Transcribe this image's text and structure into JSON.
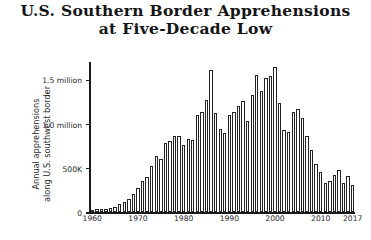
{
  "title": {
    "line1": "U.S. Southern Border Apprehensions",
    "line2": "at Five-Decade Low"
  },
  "axis": {
    "y_title_line1": "Annual apprehensions",
    "y_title_line2": "along U.S. southwest border",
    "y_ticks": [
      {
        "label": "0",
        "value": 0
      },
      {
        "label": "500K",
        "value": 500000
      },
      {
        "label": "1.0 million",
        "value": 1000000
      },
      {
        "label": "1.5 million",
        "value": 1500000
      }
    ],
    "x_ticks": [
      "1960",
      "1970",
      "1980",
      "1990",
      "2000",
      "2010",
      "2017"
    ]
  },
  "colors": {
    "background": "#ffffff",
    "axis": "#1a1a1a",
    "bar_fill": "#ffffff",
    "bar_outline": "#232323",
    "text": "#1f1f1f"
  },
  "chart_data": {
    "type": "bar",
    "title": "U.S. Southern Border Apprehensions at Five-Decade Low",
    "xlabel": "",
    "ylabel": "Annual apprehensions along U.S. southwest border",
    "ylim": [
      0,
      1700000
    ],
    "grid": false,
    "legend": null,
    "categories": [
      "1960",
      "1961",
      "1962",
      "1963",
      "1964",
      "1965",
      "1966",
      "1967",
      "1968",
      "1969",
      "1970",
      "1971",
      "1972",
      "1973",
      "1974",
      "1975",
      "1976",
      "1977",
      "1978",
      "1979",
      "1980",
      "1981",
      "1982",
      "1983",
      "1984",
      "1985",
      "1986",
      "1987",
      "1988",
      "1989",
      "1990",
      "1991",
      "1992",
      "1993",
      "1994",
      "1995",
      "1996",
      "1997",
      "1998",
      "1999",
      "2000",
      "2001",
      "2002",
      "2003",
      "2004",
      "2005",
      "2006",
      "2007",
      "2008",
      "2009",
      "2010",
      "2011",
      "2012",
      "2013",
      "2014",
      "2015",
      "2016",
      "2017"
    ],
    "values": [
      21000,
      29000,
      30000,
      39000,
      43000,
      55000,
      89000,
      108000,
      152000,
      201000,
      277000,
      348000,
      396000,
      521000,
      634000,
      596000,
      781000,
      800000,
      862000,
      867000,
      759000,
      825000,
      819000,
      1105000,
      1138000,
      1266000,
      1615000,
      1122000,
      943000,
      891000,
      1103000,
      1133000,
      1199000,
      1263000,
      1031000,
      1324000,
      1549000,
      1368000,
      1516000,
      1537000,
      1643000,
      1235000,
      929000,
      905000,
      1139000,
      1171000,
      1071000,
      858000,
      705000,
      540000,
      448000,
      327000,
      356000,
      414000,
      479000,
      331000,
      408000,
      304000
    ]
  }
}
